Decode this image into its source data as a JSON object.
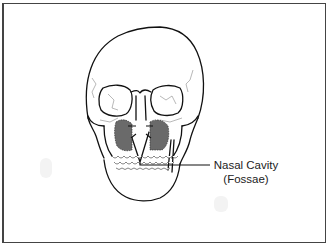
{
  "diagram": {
    "labels": [
      {
        "id": "nasal-cavity",
        "line1": "Nasal Cavity",
        "line2": "(Fossae)"
      }
    ],
    "colors": {
      "outline": "#111111",
      "suture": "#888888",
      "shading": "#6a6a6a",
      "frame": "#444444",
      "background": "#ffffff"
    }
  }
}
